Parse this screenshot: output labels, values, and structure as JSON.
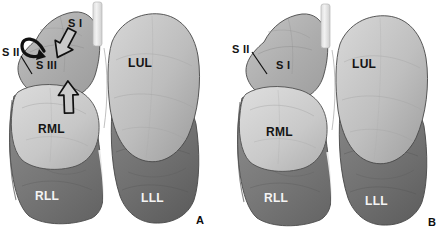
{
  "figure": {
    "background_color": "#ffffff",
    "width": 443,
    "height": 237
  },
  "palette": {
    "upper_lobe_light": "#b9b9b9",
    "middle_lobe_light": "#cfcfcf",
    "lower_lobe_dark": "#757575",
    "left_upper_light": "#c6c6c6",
    "left_lower_dark": "#6e6e6e",
    "trachea_light": "#ececec",
    "outline": "#3a3a3a",
    "label_dark": "#141414",
    "label_light": "#f4f4f4",
    "arrow_fill": "#c8c8c8",
    "arrow_stroke": "#111111"
  },
  "panels": [
    {
      "id": "A",
      "panel_label": "A",
      "labels": [
        {
          "name": "s2",
          "text": "S II",
          "sub": "II",
          "prefix": "S",
          "tone": "dark",
          "x": 2,
          "y": 47
        },
        {
          "name": "s3",
          "text": "S III",
          "sub": "III",
          "prefix": "S",
          "tone": "dark",
          "x": 36,
          "y": 60
        },
        {
          "name": "s1",
          "text": "S I",
          "sub": "I",
          "prefix": "S",
          "tone": "dark",
          "x": 68,
          "y": 18
        },
        {
          "name": "rml",
          "text": "RML",
          "tone": "dark",
          "x": 38,
          "y": 123
        },
        {
          "name": "lul",
          "text": "LUL",
          "tone": "dark",
          "x": 128,
          "y": 57
        },
        {
          "name": "rll",
          "text": "RLL",
          "tone": "light",
          "x": 35,
          "y": 190
        },
        {
          "name": "lll",
          "text": "LLL",
          "tone": "light",
          "x": 141,
          "y": 192
        }
      ],
      "annotations": {
        "leader_line_s2": "diagonal leader from S II label to right upper lobe apex",
        "hook_arrow": "curved hook arrow at right apex indicating S II segment",
        "arrow_diagonal": "hollow arrow pointing down-right toward minor fissure region",
        "arrow_vertical": "hollow arrow pointing up toward the S III / RML boundary"
      }
    },
    {
      "id": "B",
      "panel_label": "B",
      "labels": [
        {
          "name": "s2",
          "text": "S II",
          "sub": "II",
          "prefix": "S",
          "tone": "dark",
          "x": 10,
          "y": 44
        },
        {
          "name": "s1",
          "text": "S I",
          "sub": "I",
          "prefix": "S",
          "tone": "dark",
          "x": 54,
          "y": 60
        },
        {
          "name": "rml",
          "text": "RML",
          "tone": "dark",
          "x": 44,
          "y": 126
        },
        {
          "name": "lul",
          "text": "LUL",
          "tone": "dark",
          "x": 130,
          "y": 58
        },
        {
          "name": "rll",
          "text": "RLL",
          "tone": "light",
          "x": 42,
          "y": 192
        },
        {
          "name": "lll",
          "text": "LLL",
          "tone": "light",
          "x": 143,
          "y": 195
        }
      ],
      "annotations": {
        "leader_line_s2": "diagonal leader from S II label to right upper lobe apex"
      }
    }
  ],
  "legend_terms": {
    "RML": "right middle lobe",
    "RLL": "right lower lobe",
    "LUL": "left upper lobe",
    "LLL": "left lower lobe",
    "S I": "apical segment",
    "S II": "posterior segment",
    "S III": "anterior segment"
  }
}
